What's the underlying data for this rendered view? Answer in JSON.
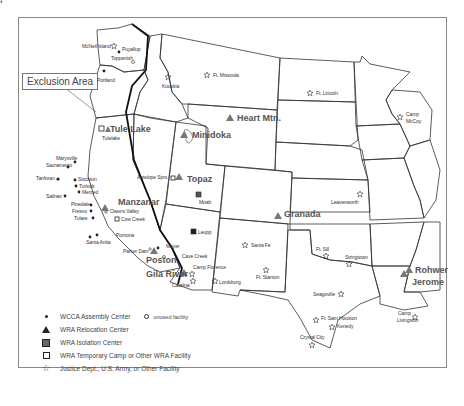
{
  "map": {
    "callout": "Exclusion Area",
    "sites": {
      "wcca": [
        "Puyallup",
        "Portland",
        "Marysville",
        "Sacramento",
        "Tanforan",
        "Stockton",
        "Turlock",
        "Merced",
        "Salinas",
        "Pinedale",
        "Fresno",
        "Tulare",
        "Pomona",
        "Santa Anita",
        "Mayer"
      ],
      "wra_relocation": [
        "Tule Lake",
        "Minidoka",
        "Heart Mtn.",
        "Topaz",
        "Manzanar",
        "Granada",
        "Poston",
        "Gila River",
        "Rohwer",
        "Jerome"
      ],
      "wra_isolation": [
        "Moab",
        "Leupp"
      ],
      "wra_temporary": [
        "Tulelake",
        "Antelope Sprs.",
        "Cow Creek"
      ],
      "justice_army": [
        "McNeil Island",
        "Kooskia",
        "Ft. Missoula",
        "Ft. Lincoln",
        "Camp McCoy",
        "Leavenworth",
        "Santa Fe",
        "Ft. Stanton",
        "Lordsburg",
        "Camp Florence",
        "Catalina",
        "Ft. Sill",
        "Stringtown",
        "Seagoville",
        "Ft. Sam Houston",
        "Kenedy",
        "Crystal City",
        "Camp Livingston"
      ],
      "unused": [
        "Toppenish",
        "Owens Valley",
        "Parker Dam",
        "Cave Creek"
      ]
    },
    "labels": {
      "mcneil": "McNeil Island",
      "puyallup": "Puyallup",
      "toppenish": "Toppenish",
      "portland": "Portland",
      "kooskia": "Kooskia",
      "missoula": "Ft. Missoula",
      "lincoln": "Ft. Lincoln",
      "mccoy1": "Camp",
      "mccoy2": "McCoy",
      "tulelake": "Tule Lake",
      "tulelake_small": "Tulelake",
      "minidoka": "Minidoka",
      "heart": "Heart Mtn.",
      "marysville": "Marysville",
      "sacramento": "Sacramento",
      "tanforan": "Tanforan",
      "stockton": "Stockton",
      "turlock": "Turlock",
      "merced": "Merced",
      "salinas": "Salinas",
      "pinedale": "Pinedale",
      "fresno": "Fresno",
      "tulare": "Tulare",
      "manzanar": "Manzanar",
      "owens": "Owens Valley",
      "cowcreek": "Cow Creek",
      "antelope": "Antelope Sprs.",
      "topaz": "Topaz",
      "moab": "Moab",
      "leupp": "Leupp",
      "pomona": "Pomona",
      "santaanita": "Santa Anita",
      "parker": "Parker Dam",
      "poston": "Poston",
      "mayer": "Mayer",
      "cavecreek": "Cave Creek",
      "florence": "Camp Florence",
      "gila": "Gila River",
      "catalina": "Catalina",
      "lordsburg": "Lordsburg",
      "santafe": "Santa Fe",
      "stanton": "Ft. Stanton",
      "granada": "Granada",
      "leavenworth": "Leavenworth",
      "sill": "Ft. Sill",
      "stringtown": "Stringtown",
      "seagoville": "Seagoville",
      "samhouston": "Ft. Sam Houston",
      "kenedy": "Kenedy",
      "crystal": "Crystal City",
      "rohwer": "Rohwer",
      "jerome": "Jerome",
      "livingston1": "Camp",
      "livingston2": "Livingston"
    }
  },
  "legend": {
    "items": [
      {
        "symbol": "filled-dot",
        "label": "WCCA Assembly Center"
      },
      {
        "symbol": "filled-triangle",
        "label": "WRA Relocation Center"
      },
      {
        "symbol": "filled-square",
        "label": "WRA Isolation Center"
      },
      {
        "symbol": "open-square",
        "label": "WRA Temporary Camp or Other WRA Facility"
      },
      {
        "symbol": "open-star",
        "label": "Justice Dept., U.S. Army, or Other Facility"
      }
    ],
    "unused_label": "unused facility"
  }
}
